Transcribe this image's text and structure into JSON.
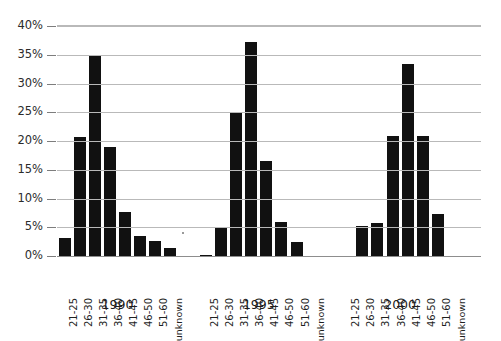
{
  "chart_data": {
    "type": "bar",
    "title": "",
    "subtitle": "",
    "xlabel": "",
    "ylabel": "",
    "ylim": [
      0,
      40
    ],
    "ytick_labels": [
      "0%",
      "5%",
      "10%",
      "15%",
      "20%",
      "25%",
      "30%",
      "35%",
      "40%"
    ],
    "ytick_values": [
      0,
      5,
      10,
      15,
      20,
      25,
      30,
      35,
      40
    ],
    "grid": true,
    "legend": "none",
    "value_unit": "%",
    "categories": [
      "21-25",
      "26-30",
      "31-35",
      "36-40",
      "41-45",
      "46-50",
      "51-60",
      "unknown"
    ],
    "groups": [
      "1990",
      "1995",
      "2000"
    ],
    "series": [
      {
        "name": "1990",
        "values": [
          3.1,
          20.7,
          34.7,
          19.0,
          7.6,
          3.4,
          2.6,
          1.4
        ]
      },
      {
        "name": "1995",
        "values": [
          0.2,
          5.1,
          25.0,
          37.2,
          16.6,
          6.0,
          2.5,
          0.0
        ]
      },
      {
        "name": "2000",
        "values": [
          0.0,
          5.2,
          5.8,
          20.8,
          33.4,
          20.8,
          7.3,
          0.0
        ]
      }
    ]
  }
}
